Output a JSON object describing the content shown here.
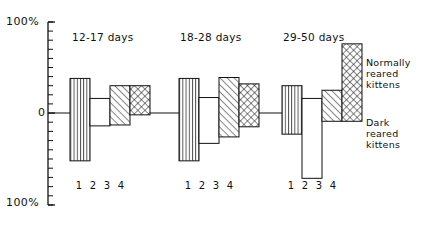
{
  "axis": {
    "top_label": "100%",
    "zero_label": "0",
    "bottom_label": "100%"
  },
  "legend": {
    "normal": "Normally\nreared\nkittens",
    "dark": "Dark\nreared\nkittens"
  },
  "tick_labels": "1 2 3 4",
  "colors": {
    "ink": "#111111",
    "background": "#ffffff"
  },
  "chart_data": {
    "type": "bar",
    "title": "",
    "subtitle": "",
    "xlabel": "",
    "ylabel": "",
    "ylim": [
      -100,
      100
    ],
    "y_tick_labels": [
      "100%",
      "0",
      "100%"
    ],
    "y_major_ticks": [
      100,
      0,
      -100
    ],
    "y_minor_tick_interval": 10,
    "grid": false,
    "legend_position": "right",
    "axis_style": "left-spine-only",
    "orientation": "vertical",
    "note": "Each bar spans from a negative to a positive value (range bar) around the 0 baseline. Values are percent.",
    "bar_fill_patterns": [
      "vertical-lines",
      "blank",
      "diagonal-hatch",
      "cross-hatch"
    ],
    "legend_entries": [
      {
        "name": "Normally reared kittens",
        "patterns": [
          "vertical-lines",
          "diagonal-hatch",
          "cross-hatch"
        ]
      },
      {
        "name": "Dark reared kittens",
        "patterns": [
          "blank"
        ]
      }
    ],
    "categories": [
      "1",
      "2",
      "3",
      "4"
    ],
    "groups": [
      {
        "label": "12-17 days",
        "bars": [
          {
            "category": "1",
            "pattern": "vertical-lines",
            "top": 38,
            "bottom": -52
          },
          {
            "category": "2",
            "pattern": "blank",
            "top": 16,
            "bottom": -14
          },
          {
            "category": "3",
            "pattern": "diagonal-hatch",
            "top": 30,
            "bottom": -13
          },
          {
            "category": "4",
            "pattern": "cross-hatch",
            "top": 30,
            "bottom": -2
          }
        ]
      },
      {
        "label": "18-28 days",
        "bars": [
          {
            "category": "1",
            "pattern": "vertical-lines",
            "top": 38,
            "bottom": -52
          },
          {
            "category": "2",
            "pattern": "blank",
            "top": 17,
            "bottom": -33
          },
          {
            "category": "3",
            "pattern": "diagonal-hatch",
            "top": 39,
            "bottom": -26
          },
          {
            "category": "4",
            "pattern": "cross-hatch",
            "top": 32,
            "bottom": -15
          }
        ]
      },
      {
        "label": "29-50 days",
        "bars": [
          {
            "category": "1",
            "pattern": "vertical-lines",
            "top": 30,
            "bottom": -23
          },
          {
            "category": "2",
            "pattern": "blank",
            "top": 16,
            "bottom": -71
          },
          {
            "category": "3",
            "pattern": "diagonal-hatch",
            "top": 25,
            "bottom": -9
          },
          {
            "category": "4",
            "pattern": "cross-hatch",
            "top": 76,
            "bottom": -9
          }
        ]
      }
    ],
    "geometry": {
      "plot_left_px": 48,
      "zero_y_px": 113,
      "top_y_px": 22,
      "bottom_y_px": 205,
      "bar_width_px": 20,
      "group_starts_px": [
        70,
        179,
        282
      ]
    }
  }
}
